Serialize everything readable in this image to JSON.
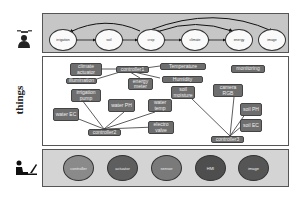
{
  "layers": {
    "top": {
      "icon": "farmer-with-drone-icon",
      "nodes": [
        "irrigation",
        "soil",
        "crop",
        "climate",
        "energy",
        "image"
      ]
    },
    "middle": {
      "label": "things",
      "boxes": {
        "climate_actuator": "climate actuator",
        "controller1": "controller1",
        "illumination": "illumination",
        "energy_meter": "energy meter",
        "temperature": "Temperature",
        "humidity": "Humidity",
        "soil_moisture": "soil moisture",
        "monitoring": "monitoring",
        "camera_rgb": "camera RGB",
        "irrigation_pump": "irrigation pump",
        "water_ph": "water PH",
        "water_temp": "water temp",
        "water_ec": "water EC",
        "electro_valve": "electro valve",
        "soil_ph": "soil PH",
        "soil_ec": "soil EC",
        "controller2": "controller2",
        "controller3": "controller3"
      }
    },
    "bottom": {
      "icon": "person-at-computer-icon",
      "circles": [
        {
          "label": "controller",
          "color": "#8a8a8a"
        },
        {
          "label": "actuator",
          "color": "#5e5e5e"
        },
        {
          "label": "sensor",
          "color": "#7a7a7a"
        },
        {
          "label": "HMI",
          "color": "#4e4e4e"
        },
        {
          "label": "image",
          "color": "#555555"
        }
      ]
    }
  }
}
